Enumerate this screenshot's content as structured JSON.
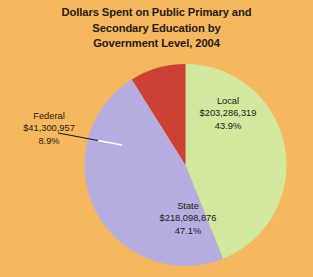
{
  "chart_data": {
    "type": "pie",
    "title": "Dollars Spent on Public Primary and Secondary Education by Government Level, 2004",
    "title_lines": [
      "Dollars Spent on Public Primary and",
      "Secondary Education by",
      "Government Level, 2004"
    ],
    "categories": [
      "Local",
      "State",
      "Federal"
    ],
    "values": [
      203286319,
      218098876,
      41300957
    ],
    "percentages": [
      43.9,
      47.1,
      8.9
    ],
    "value_labels": [
      "$203,286,319",
      "$218,098,876",
      "$41,300,957"
    ],
    "percent_labels": [
      "43.9%",
      "47.1%",
      "8.9%"
    ],
    "colors": [
      "#d2e89e",
      "#b6aee0",
      "#cc3f34"
    ],
    "start_angle_deg": 0,
    "direction": "clockwise",
    "legend": "none",
    "grid": false,
    "xlabel": "",
    "ylabel": "",
    "background_color": "#f5b85e",
    "title_color": "#241a11",
    "label_color": "#1d1a14",
    "slices": [
      {
        "name": "Local",
        "value": 203286319,
        "value_label": "$203,286,319",
        "percent": 43.9,
        "percent_label": "43.9%",
        "color": "#d2e89e",
        "label_placement": "inside"
      },
      {
        "name": "State",
        "value": 218098876,
        "value_label": "$218,098,876",
        "percent": 47.1,
        "percent_label": "47.1%",
        "color": "#b6aee0",
        "label_placement": "inside"
      },
      {
        "name": "Federal",
        "value": 41300957,
        "value_label": "$41,300,957",
        "percent": 8.9,
        "percent_label": "8.9%",
        "color": "#cc3f34",
        "label_placement": "outside-left-with-leader"
      }
    ]
  }
}
